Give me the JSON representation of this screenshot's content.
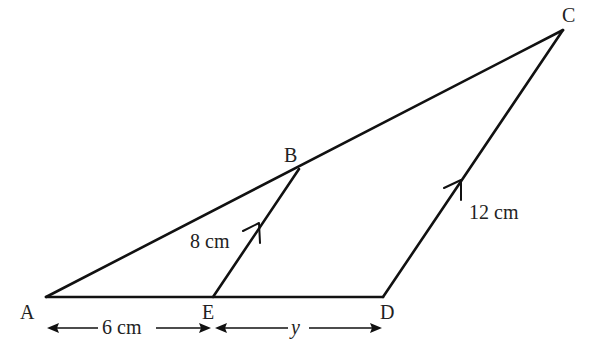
{
  "figure": {
    "points": {
      "A": {
        "label": "A"
      },
      "B": {
        "label": "B"
      },
      "C": {
        "label": "C"
      },
      "D": {
        "label": "D"
      },
      "E": {
        "label": "E"
      }
    },
    "measurements": {
      "BE": "8 cm",
      "CD": "12 cm",
      "AE": "6 cm",
      "ED": "y"
    },
    "notes": {
      "parallel": "BE ∥ CD (arrow marks)"
    },
    "colors": {
      "stroke": "#111111",
      "text": "#222222",
      "background": "#ffffff"
    }
  }
}
